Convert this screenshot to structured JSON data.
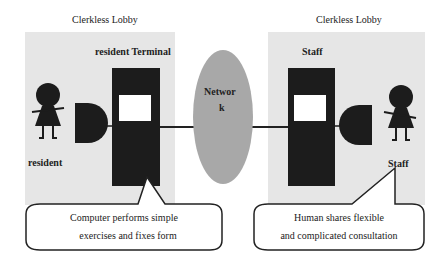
{
  "diagram": {
    "left_lobby": {
      "title": "Clerkless Lobby",
      "terminal_label": "resident Terminal",
      "person_label": "resident",
      "callout": {
        "line1": "Computer performs simple",
        "line2": "exercises and fixes form"
      }
    },
    "network": {
      "label_line1": "Networ",
      "label_line2": "k"
    },
    "right_lobby": {
      "title": "Clerkless Lobby",
      "terminal_label": "Staff",
      "person_label": "Staff",
      "callout": {
        "line1": "Human shares flexible",
        "line2": "and complicated consultation"
      }
    },
    "colors": {
      "panel": "#e6e6e6",
      "terminal": "#1c1c1c",
      "screen": "#ffffff",
      "network": "#a8a8a8",
      "outline": "#222222"
    }
  }
}
